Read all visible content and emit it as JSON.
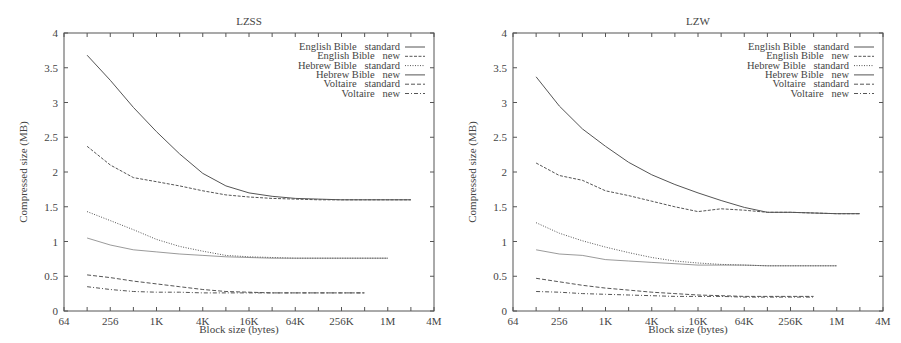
{
  "chart_data": [
    {
      "type": "line",
      "title": "LZSS",
      "xlabel": "Block size (bytes)",
      "ylabel": "Compressed size (MB)",
      "xscale": "log2",
      "xticks": [
        "64",
        "256",
        "1K",
        "4K",
        "16K",
        "64K",
        "256K",
        "1M",
        "4M"
      ],
      "yticks": [
        "0",
        "0.5",
        "1",
        "1.5",
        "2",
        "2.5",
        "3",
        "3.5",
        "4"
      ],
      "ylim": [
        0,
        4
      ],
      "xlim_log2": [
        6,
        22
      ],
      "grid": false,
      "legend_position": "top-right",
      "series": [
        {
          "name": "English Bible   standard",
          "style": "solid",
          "start_log2": 7,
          "values": [
            3.68,
            3.32,
            2.93,
            2.58,
            2.26,
            1.98,
            1.8,
            1.7,
            1.65,
            1.62,
            1.61,
            1.6,
            1.6,
            1.6,
            1.6
          ]
        },
        {
          "name": "English Bible   new",
          "style": "dashed",
          "start_log2": 7,
          "values": [
            2.37,
            2.1,
            1.92,
            1.86,
            1.8,
            1.73,
            1.67,
            1.64,
            1.62,
            1.61,
            1.6,
            1.6,
            1.6,
            1.6,
            1.6
          ]
        },
        {
          "name": "Hebrew Bible   standard",
          "style": "dotted",
          "start_log2": 7,
          "values": [
            1.43,
            1.3,
            1.17,
            1.03,
            0.93,
            0.86,
            0.8,
            0.78,
            0.77,
            0.76,
            0.76,
            0.76,
            0.76,
            0.76
          ]
        },
        {
          "name": "Hebrew Bible   new",
          "style": "solid-light",
          "start_log2": 7,
          "values": [
            1.05,
            0.95,
            0.88,
            0.85,
            0.82,
            0.8,
            0.78,
            0.77,
            0.76,
            0.76,
            0.76,
            0.76,
            0.76,
            0.76
          ]
        },
        {
          "name": "Voltaire   standard",
          "style": "dash",
          "start_log2": 7,
          "values": [
            0.52,
            0.48,
            0.43,
            0.39,
            0.35,
            0.31,
            0.28,
            0.27,
            0.26,
            0.26,
            0.26,
            0.26,
            0.26
          ]
        },
        {
          "name": "Voltaire   new",
          "style": "dashdot",
          "start_log2": 7,
          "values": [
            0.35,
            0.31,
            0.28,
            0.27,
            0.27,
            0.26,
            0.26,
            0.26,
            0.26,
            0.26,
            0.26,
            0.26,
            0.26
          ]
        }
      ]
    },
    {
      "type": "line",
      "title": "LZW",
      "xlabel": "Block size (bytes)",
      "ylabel": "Compressed size (MB)",
      "xscale": "log2",
      "xticks": [
        "64",
        "256",
        "1K",
        "4K",
        "16K",
        "64K",
        "256K",
        "1M",
        "4M"
      ],
      "yticks": [
        "0",
        "0.5",
        "1",
        "1.5",
        "2",
        "2.5",
        "3",
        "3.5",
        "4"
      ],
      "ylim": [
        0,
        4
      ],
      "xlim_log2": [
        6,
        22
      ],
      "grid": false,
      "legend_position": "top-right",
      "series": [
        {
          "name": "English Bible   standard",
          "style": "solid",
          "start_log2": 7,
          "values": [
            3.37,
            2.95,
            2.62,
            2.37,
            2.14,
            1.96,
            1.82,
            1.7,
            1.59,
            1.49,
            1.42,
            1.42,
            1.41,
            1.4,
            1.4
          ]
        },
        {
          "name": "English Bible   new",
          "style": "dashed",
          "start_log2": 7,
          "values": [
            2.13,
            1.95,
            1.88,
            1.73,
            1.66,
            1.58,
            1.5,
            1.43,
            1.47,
            1.45,
            1.42,
            1.42,
            1.41,
            1.4,
            1.4
          ]
        },
        {
          "name": "Hebrew Bible   standard",
          "style": "dotted",
          "start_log2": 7,
          "values": [
            1.27,
            1.12,
            1.01,
            0.92,
            0.84,
            0.77,
            0.72,
            0.69,
            0.67,
            0.66,
            0.65,
            0.65,
            0.65,
            0.65
          ]
        },
        {
          "name": "Hebrew Bible   new",
          "style": "solid-light",
          "start_log2": 7,
          "values": [
            0.88,
            0.82,
            0.8,
            0.74,
            0.72,
            0.7,
            0.68,
            0.66,
            0.66,
            0.66,
            0.65,
            0.65,
            0.65,
            0.65
          ]
        },
        {
          "name": "Voltaire   standard",
          "style": "dash",
          "start_log2": 7,
          "values": [
            0.47,
            0.42,
            0.37,
            0.33,
            0.3,
            0.27,
            0.25,
            0.23,
            0.22,
            0.21,
            0.21,
            0.21,
            0.21
          ]
        },
        {
          "name": "Voltaire   new",
          "style": "dashdot",
          "start_log2": 7,
          "values": [
            0.28,
            0.27,
            0.25,
            0.24,
            0.23,
            0.22,
            0.21,
            0.21,
            0.21,
            0.2,
            0.2,
            0.2,
            0.2
          ]
        }
      ]
    }
  ],
  "colors": {
    "line": "#555555",
    "axis": "#555555",
    "text": "#444444",
    "background": "#ffffff"
  }
}
